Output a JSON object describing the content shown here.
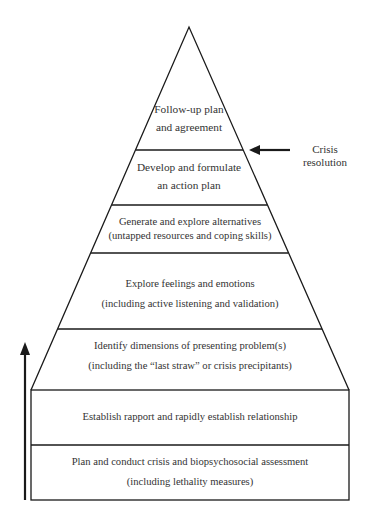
{
  "diagram": {
    "type": "pyramid",
    "layers": [
      {
        "id": "L7",
        "order": 7,
        "lines": [
          "Follow-up plan",
          "and agreement"
        ]
      },
      {
        "id": "L6",
        "order": 6,
        "lines": [
          "Develop and formulate",
          "an action plan"
        ]
      },
      {
        "id": "L5",
        "order": 5,
        "lines": [
          "Generate and explore alternatives",
          "(untapped resources and coping skills)"
        ]
      },
      {
        "id": "L4",
        "order": 4,
        "lines": [
          "Explore feelings and emotions",
          "(including active listening and validation)"
        ]
      },
      {
        "id": "L3",
        "order": 3,
        "lines": [
          "Identify dimensions of presenting problem(s)",
          "(including the “last straw” or crisis precipitants)"
        ]
      },
      {
        "id": "L2",
        "order": 2,
        "lines": [
          "Establish rapport and rapidly establish relationship"
        ]
      },
      {
        "id": "L1",
        "order": 1,
        "lines": [
          "Plan and conduct crisis and biopsychosocial assessment",
          "(including lethality measures)"
        ]
      }
    ],
    "annotation": {
      "lines": [
        "Crisis",
        "resolution"
      ],
      "points_to": "boundary between L7 and L6"
    },
    "progress_arrow": {
      "direction": "up",
      "meaning": "sequence from L1 to L7"
    },
    "colors": {
      "line": "#1a1a1a",
      "text": "#333333",
      "background": "#ffffff"
    }
  }
}
